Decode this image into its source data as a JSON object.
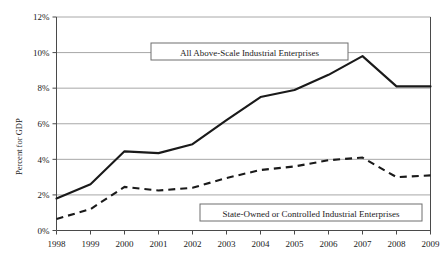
{
  "chart_data": {
    "type": "line",
    "title": "",
    "xlabel": "",
    "ylabel": "Percent for GDP",
    "categories": [
      "1998",
      "1999",
      "2000",
      "2001",
      "2002",
      "2003",
      "2004",
      "2005",
      "2006",
      "2007",
      "2008",
      "2009"
    ],
    "x": [
      1998,
      1999,
      2000,
      2001,
      2002,
      2003,
      2004,
      2005,
      2006,
      2007,
      2008,
      2009
    ],
    "ylim": [
      0,
      12
    ],
    "xlim": [
      1998,
      2009
    ],
    "ytick_labels": [
      "0%",
      "2%",
      "4%",
      "6%",
      "8%",
      "10%",
      "12%"
    ],
    "ytick_values": [
      0,
      2,
      4,
      6,
      8,
      10,
      12
    ],
    "xtick_labels": [
      "1998",
      "1999",
      "2000",
      "2001",
      "2002",
      "2003",
      "2004",
      "2005",
      "2006",
      "2007",
      "2008",
      "2009"
    ],
    "grid": "horizontal",
    "legend_position": "inline-annotations",
    "series": [
      {
        "name": "All Above-Scale Industrial Enterprises",
        "style": "solid",
        "color": "#1a1a1a",
        "values": [
          1.8,
          2.6,
          4.45,
          4.35,
          4.85,
          6.2,
          7.5,
          7.9,
          8.75,
          9.8,
          8.1,
          8.1
        ]
      },
      {
        "name": "State-Owned or Controlled Industrial Enterprises",
        "style": "dashed",
        "color": "#1a1a1a",
        "values": [
          0.65,
          1.2,
          2.45,
          2.25,
          2.4,
          2.95,
          3.4,
          3.6,
          3.95,
          4.1,
          3.0,
          3.1
        ]
      }
    ],
    "annotations": [
      {
        "label": "All Above-Scale Industrial Enterprises",
        "boxed": true
      },
      {
        "label": "State-Owned or Controlled Industrial Enterprises",
        "boxed": true
      }
    ],
    "colors": {
      "grid": "#a8a8a8",
      "axis": "#4a4a4a",
      "line": "#1a1a1a",
      "background": "#ffffff",
      "annotation_border": "#6e6e6e"
    }
  }
}
